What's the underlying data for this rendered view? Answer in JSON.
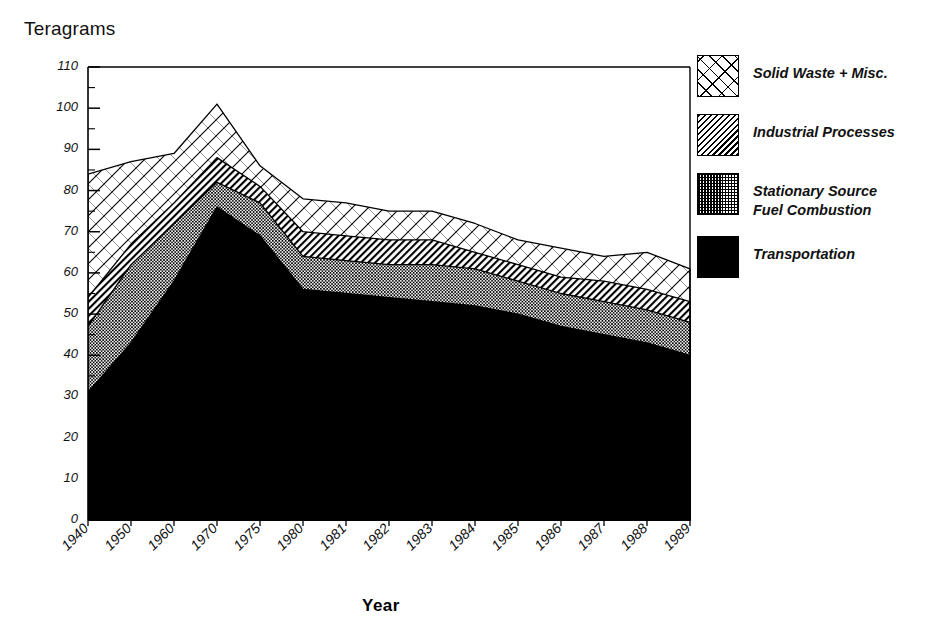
{
  "chart_data": {
    "type": "area",
    "title": "",
    "xlabel": "Year",
    "ylabel": "Teragrams",
    "ylim": [
      0,
      110
    ],
    "ytick_step": 10,
    "yticks": [
      0,
      10,
      20,
      30,
      40,
      50,
      60,
      70,
      80,
      90,
      100,
      110
    ],
    "minor_ytick_step": 5,
    "grid": false,
    "stacked": true,
    "legend_position": "right",
    "categories": [
      "1940",
      "1950",
      "1960",
      "1970",
      "1975",
      "1980",
      "1981",
      "1982",
      "1983",
      "1984",
      "1985",
      "1986",
      "1987",
      "1988",
      "1989"
    ],
    "series": [
      {
        "name": "Transportation",
        "fill": "solid-black",
        "color": "#000000",
        "values": [
          31,
          43,
          58,
          76,
          69,
          56,
          55,
          54,
          53,
          52,
          50,
          47,
          45,
          43,
          40
        ]
      },
      {
        "name": "Stationary Source Fuel Combustion",
        "fill": "checkerboard",
        "color": "#555555",
        "values": [
          47,
          62,
          72,
          82,
          77,
          64,
          63,
          62,
          62,
          61,
          58,
          55,
          53,
          51,
          48
        ]
      },
      {
        "name": "Industrial Processes",
        "fill": "diagonal-hatch",
        "color": "#888888",
        "values": [
          54,
          67,
          77,
          88,
          81,
          70,
          69,
          68,
          68,
          65,
          62,
          59,
          58,
          56,
          53
        ]
      },
      {
        "name": "Solid Waste + Misc.",
        "fill": "cross-hatch",
        "color": "#ffffff",
        "values": [
          84,
          87,
          89,
          101,
          86,
          78,
          77,
          75,
          75,
          72,
          68,
          66,
          64,
          65,
          61
        ]
      }
    ]
  },
  "axis": {
    "y_title": "Teragrams",
    "x_title": "Year"
  },
  "legend": {
    "items": [
      {
        "label": "Solid Waste + Misc.",
        "swatch": "cross-hatch-swatch"
      },
      {
        "label": "Industrial Processes",
        "swatch": "diagonal-hatch-swatch"
      },
      {
        "label": "Stationary Source\nFuel Combustion",
        "swatch": "checkerboard-swatch"
      },
      {
        "label": "Transportation",
        "swatch": "solid-black-swatch"
      }
    ]
  }
}
